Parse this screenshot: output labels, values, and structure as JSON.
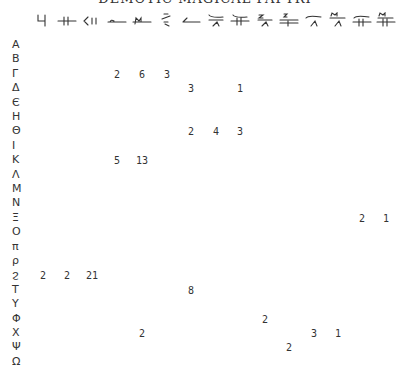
{
  "title": "DEMOTIC MAGICAL PAPYRI",
  "columns": [
    {
      "name": "col-1-sign",
      "x": 43
    },
    {
      "name": "col-2-sign",
      "x": 67
    },
    {
      "name": "col-3-sign",
      "x": 92
    },
    {
      "name": "col-4-sign",
      "x": 117
    },
    {
      "name": "col-5-sign",
      "x": 142
    },
    {
      "name": "col-6-sign",
      "x": 167
    },
    {
      "name": "col-7-sign",
      "x": 191
    },
    {
      "name": "col-8-sign",
      "x": 216
    },
    {
      "name": "col-9-sign",
      "x": 240
    },
    {
      "name": "col-10-sign",
      "x": 265
    },
    {
      "name": "col-11-sign",
      "x": 289
    },
    {
      "name": "col-12-sign",
      "x": 314
    },
    {
      "name": "col-13-sign",
      "x": 338
    },
    {
      "name": "col-14-sign",
      "x": 362
    },
    {
      "name": "col-15-sign",
      "x": 386
    }
  ],
  "rows": [
    {
      "label": "A",
      "values": {}
    },
    {
      "label": "B",
      "values": {}
    },
    {
      "label": "Γ",
      "values": {
        "4": "2",
        "5": "6",
        "6": "3"
      }
    },
    {
      "label": "Δ",
      "values": {
        "7": "3",
        "9": "1"
      }
    },
    {
      "label": "Є",
      "values": {}
    },
    {
      "label": "H",
      "values": {}
    },
    {
      "label": "Θ",
      "values": {
        "7": "2",
        "8": "4",
        "9": "3"
      }
    },
    {
      "label": "I",
      "values": {}
    },
    {
      "label": "K",
      "values": {
        "4": "5",
        "5": "13"
      }
    },
    {
      "label": "Λ",
      "values": {}
    },
    {
      "label": "M",
      "values": {}
    },
    {
      "label": "N",
      "values": {}
    },
    {
      "label": "Ξ",
      "values": {
        "14": "2",
        "15": "1"
      }
    },
    {
      "label": "O",
      "values": {}
    },
    {
      "label": "π",
      "values": {}
    },
    {
      "label": "ρ",
      "values": {}
    },
    {
      "label": "ϩ",
      "values": {
        "1": "2",
        "2": "2",
        "3": "21"
      }
    },
    {
      "label": "T",
      "values": {
        "7": "8"
      }
    },
    {
      "label": "Y",
      "values": {}
    },
    {
      "label": "Φ",
      "values": {
        "10": "2"
      }
    },
    {
      "label": "X",
      "values": {
        "5": "2",
        "12": "3",
        "13": "1"
      }
    },
    {
      "label": "Ψ",
      "values": {
        "11": "2"
      }
    },
    {
      "label": "Ω",
      "values": {}
    }
  ]
}
